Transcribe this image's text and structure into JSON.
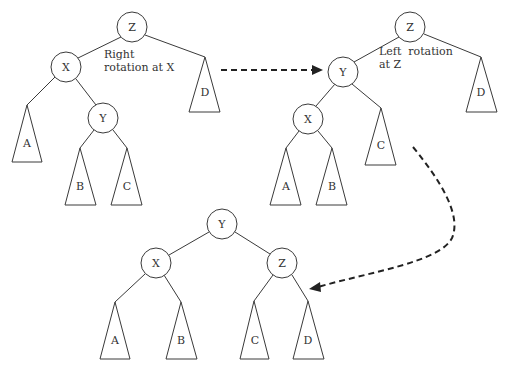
{
  "diagram": {
    "colors": {
      "line": "#3a3a3a",
      "text": "#333333",
      "arrow": "#222222",
      "background": "#ffffff"
    },
    "steps": [
      {
        "id": "initial",
        "caption": [
          "Right",
          "rotation at X"
        ],
        "nodes": [
          {
            "label": "Z",
            "x": 132,
            "y": 27
          },
          {
            "label": "X",
            "x": 66,
            "y": 67
          },
          {
            "label": "Y",
            "x": 103,
            "y": 118
          }
        ],
        "subtrees": [
          {
            "label": "A",
            "apex": [
              27,
              105
            ],
            "base": [
              12,
              42,
              162
            ]
          },
          {
            "label": "B",
            "apex": [
              80,
              148
            ],
            "base": [
              65,
              96,
              205
            ]
          },
          {
            "label": "C",
            "apex": [
              127,
              148
            ],
            "base": [
              111,
              142,
              205
            ]
          },
          {
            "label": "D",
            "apex": [
              205,
              57
            ],
            "base": [
              189,
              220,
              112
            ]
          }
        ]
      },
      {
        "id": "after-right-rotation",
        "caption": [
          "Left  rotation",
          "at Z"
        ],
        "nodes": [
          {
            "label": "Z",
            "x": 410,
            "y": 27
          },
          {
            "label": "Y",
            "x": 343,
            "y": 72
          },
          {
            "label": "X",
            "x": 308,
            "y": 119
          }
        ],
        "subtrees": [
          {
            "label": "A",
            "apex": [
              286,
              148
            ],
            "base": [
              270,
              301,
              205
            ]
          },
          {
            "label": "B",
            "apex": [
              332,
              148
            ],
            "base": [
              316,
              347,
              205
            ]
          },
          {
            "label": "C",
            "apex": [
              381,
              108
            ],
            "base": [
              365,
              396,
              165
            ]
          },
          {
            "label": "D",
            "apex": [
              481,
              57
            ],
            "base": [
              466,
              497,
              112
            ]
          }
        ]
      },
      {
        "id": "balanced",
        "nodes": [
          {
            "label": "Y",
            "x": 222,
            "y": 224
          },
          {
            "label": "X",
            "x": 156,
            "y": 263
          },
          {
            "label": "Z",
            "x": 282,
            "y": 263
          }
        ],
        "subtrees": [
          {
            "label": "A",
            "apex": [
              115,
              302
            ],
            "base": [
              100,
              130,
              359
            ]
          },
          {
            "label": "B",
            "apex": [
              181,
              302
            ],
            "base": [
              166,
              197,
              359
            ]
          },
          {
            "label": "C",
            "apex": [
              254,
              301
            ],
            "base": [
              240,
              269,
              359
            ]
          },
          {
            "label": "D",
            "apex": [
              308,
              301
            ],
            "base": [
              293,
              324,
              359
            ]
          }
        ]
      }
    ],
    "arrows": [
      {
        "from": "initial",
        "to": "after-right-rotation",
        "style": "dashed-straight"
      },
      {
        "from": "after-right-rotation",
        "to": "balanced",
        "style": "dashed-curved"
      }
    ]
  }
}
